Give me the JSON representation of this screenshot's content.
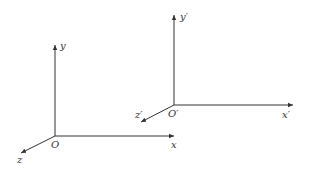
{
  "diagram": {
    "type": "coordinate-frames",
    "frames": [
      {
        "name": "frame-original",
        "origin_label": "O",
        "x_label": "x",
        "y_label": "y",
        "z_label": "z"
      },
      {
        "name": "frame-primed",
        "origin_label": "O′",
        "x_label": "x′",
        "y_label": "y′",
        "z_label": "z′"
      }
    ],
    "colors": {
      "stroke": "#333333",
      "background": "#ffffff"
    }
  }
}
